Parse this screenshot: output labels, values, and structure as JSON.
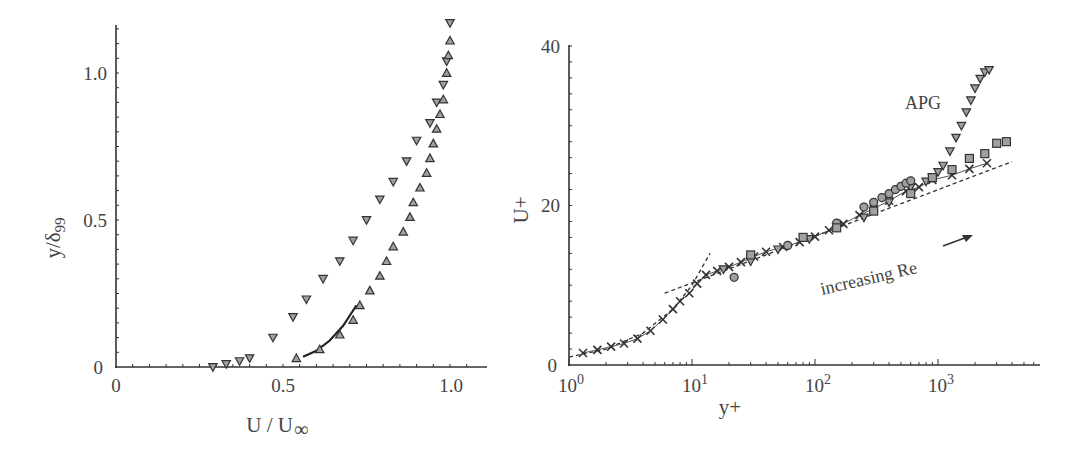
{
  "chart_data": [
    {
      "type": "scatter",
      "title": "",
      "xlabel": "U / U∞",
      "ylabel": "y/δ",
      "ylabel_sub": "99",
      "xlim": [
        0,
        1.1
      ],
      "ylim": [
        0,
        1.2
      ],
      "xticks": [
        "0",
        "0.5",
        "1.0"
      ],
      "yticks": [
        "0",
        "0.5",
        "1.0"
      ],
      "grid": false,
      "series": [
        {
          "name": "APG (down triangles)",
          "marker": "triangle-down",
          "x": [
            0.29,
            0.33,
            0.37,
            0.4,
            0.47,
            0.53,
            0.57,
            0.62,
            0.67,
            0.71,
            0.75,
            0.79,
            0.83,
            0.87,
            0.9,
            0.94,
            0.96,
            0.98,
            0.99,
            1.0
          ],
          "y": [
            0.0,
            0.01,
            0.02,
            0.03,
            0.1,
            0.17,
            0.23,
            0.3,
            0.36,
            0.43,
            0.5,
            0.57,
            0.63,
            0.7,
            0.77,
            0.83,
            0.9,
            0.96,
            1.04,
            1.17
          ]
        },
        {
          "name": "ZPG (up triangles)",
          "marker": "triangle-up",
          "x": [
            0.54,
            0.61,
            0.67,
            0.71,
            0.73,
            0.76,
            0.79,
            0.81,
            0.83,
            0.86,
            0.88,
            0.89,
            0.91,
            0.93,
            0.94,
            0.95,
            0.96,
            0.97,
            0.98,
            0.99,
            0.995,
            1.0
          ],
          "y": [
            0.03,
            0.06,
            0.11,
            0.16,
            0.21,
            0.26,
            0.31,
            0.36,
            0.41,
            0.46,
            0.51,
            0.56,
            0.61,
            0.66,
            0.71,
            0.76,
            0.81,
            0.86,
            0.91,
            1.0,
            1.06,
            1.11
          ]
        },
        {
          "name": "solid line",
          "marker": "line",
          "x": [
            0.56,
            0.6,
            0.64,
            0.68,
            0.72
          ],
          "y": [
            0.035,
            0.055,
            0.09,
            0.14,
            0.21
          ]
        }
      ]
    },
    {
      "type": "scatter",
      "title": "",
      "xlabel": "y+",
      "ylabel": "U+",
      "xscale": "log",
      "xlim": [
        1,
        6000
      ],
      "ylim": [
        0,
        40
      ],
      "xticks": [
        "10^0",
        "10^1",
        "10^2",
        "10^3"
      ],
      "yticks": [
        "0",
        "20",
        "40"
      ],
      "grid": false,
      "annotations": [
        "APG",
        "increasing Re"
      ],
      "series": [
        {
          "name": "crosses",
          "marker": "x",
          "x": [
            1.3,
            1.7,
            2.2,
            2.8,
            3.6,
            4.6,
            5.8,
            7.0,
            8.0,
            9.5,
            11,
            13,
            16,
            20,
            25,
            32,
            40,
            55,
            75,
            100,
            130,
            170,
            230,
            300,
            400,
            550,
            700,
            900,
            1300,
            1800,
            2500
          ],
          "y": [
            1.5,
            1.9,
            2.3,
            2.7,
            3.3,
            4.3,
            5.7,
            7.0,
            8.0,
            9.0,
            10.2,
            11.3,
            11.8,
            12.3,
            12.9,
            13.6,
            14.2,
            14.8,
            15.4,
            16.1,
            16.9,
            17.7,
            18.8,
            19.6,
            20.6,
            21.8,
            22.3,
            23.2,
            23.8,
            24.6,
            25.3
          ]
        },
        {
          "name": "APG (down triangles)",
          "marker": "triangle-down",
          "x": [
            18,
            30,
            50,
            90,
            150,
            250,
            400,
            600,
            800,
            900,
            1000,
            1100,
            1250,
            1400,
            1550,
            1700,
            1850,
            2000,
            2200,
            2400,
            2600
          ],
          "y": [
            12.0,
            13.0,
            14.5,
            15.8,
            17.3,
            18.5,
            20.4,
            22.3,
            23.0,
            23.5,
            24.2,
            25.0,
            26.8,
            28.5,
            30.0,
            31.7,
            33.2,
            34.7,
            35.9,
            36.7,
            37.0
          ]
        },
        {
          "name": "circles",
          "marker": "circle",
          "x": [
            22,
            60,
            150,
            250,
            300,
            350,
            400,
            450,
            500,
            550,
            600
          ],
          "y": [
            11.0,
            15.0,
            17.8,
            19.8,
            20.4,
            21.0,
            21.5,
            22.0,
            22.4,
            22.8,
            23.1
          ]
        },
        {
          "name": "squares",
          "marker": "square",
          "x": [
            30,
            80,
            150,
            300,
            600,
            900,
            1300,
            1800,
            2400,
            3000,
            3600
          ],
          "y": [
            13.8,
            16.0,
            17.2,
            19.3,
            21.5,
            23.5,
            24.5,
            25.9,
            26.5,
            27.8,
            28.0
          ]
        },
        {
          "name": "log law (dashed)",
          "marker": "dashed-line",
          "x": [
            6,
            4000
          ],
          "y": [
            9.0,
            25.5
          ]
        },
        {
          "name": "viscous sublayer U+=y+ (dashed)",
          "marker": "dashed-line",
          "x": [
            1,
            2,
            4,
            7,
            10,
            14
          ],
          "y": [
            1,
            2,
            4,
            7,
            10,
            14
          ]
        }
      ]
    }
  ],
  "left": {
    "ticks": {
      "x0": "0",
      "x05": "0.5",
      "x10": "1.0",
      "y0": "0",
      "y05": "0.5",
      "y10": "1.0"
    },
    "xlabel": "U / U",
    "xlabel_sub": "∞",
    "ylabel": "y/δ",
    "ylabel_sub": "99"
  },
  "right": {
    "ticks": {
      "y0": "0",
      "y20": "20",
      "y40": "40",
      "x0": "10",
      "x0e": "0",
      "x1": "10",
      "x1e": "1",
      "x2": "10",
      "x2e": "2",
      "x3": "10",
      "x3e": "3"
    },
    "xlabel": "y+",
    "ylabel": "U+",
    "annot_apg": "APG",
    "annot_re": "increasing Re"
  },
  "colors": {
    "axis": "#333333",
    "marker_fill": "#a0a0a0",
    "marker_stroke": "#333333",
    "text": "#444444"
  }
}
